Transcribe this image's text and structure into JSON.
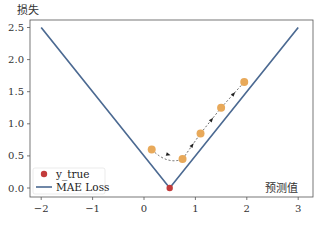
{
  "chart_data": {
    "type": "line",
    "title": "",
    "xlabel": "预测值",
    "ylabel": "损失",
    "xlim": [
      -2.2,
      3.3
    ],
    "ylim": [
      -0.12,
      2.6
    ],
    "xticks": [
      -2,
      -1,
      0,
      1,
      2,
      3
    ],
    "xtick_labels": [
      "−2",
      "−1",
      "0",
      "1",
      "2",
      "3"
    ],
    "yticks": [
      0.0,
      0.5,
      1.0,
      1.5,
      2.0,
      2.5
    ],
    "ytick_labels": [
      "0.0",
      "0.5",
      "1.0",
      "1.5",
      "2.0",
      "2.5"
    ],
    "grid": false,
    "legend_position": "lower left",
    "series": [
      {
        "name": "MAE Loss",
        "kind": "line",
        "color": "#4c6a92",
        "x": [
          -2,
          0.5,
          3
        ],
        "y": [
          2.5,
          0.0,
          2.5
        ]
      },
      {
        "name": "y_true",
        "kind": "scatter",
        "color": "#c23b3b",
        "x": [
          0.5
        ],
        "y": [
          0.0
        ]
      },
      {
        "name": "predictions",
        "kind": "scatter-path",
        "color": "#e8a95a",
        "line_style": "dashed",
        "line_color": "#444444",
        "x": [
          0.15,
          0.75,
          1.1,
          1.5,
          1.95
        ],
        "y": [
          0.6,
          0.45,
          0.85,
          1.25,
          1.65
        ]
      }
    ]
  },
  "legend": {
    "items": [
      {
        "label": "y_true",
        "type": "marker",
        "color": "#c23b3b"
      },
      {
        "label": "MAE Loss",
        "type": "line",
        "color": "#4c6a92"
      }
    ]
  },
  "axes": {
    "ylabel": "损失",
    "xlabel": "预测值"
  }
}
